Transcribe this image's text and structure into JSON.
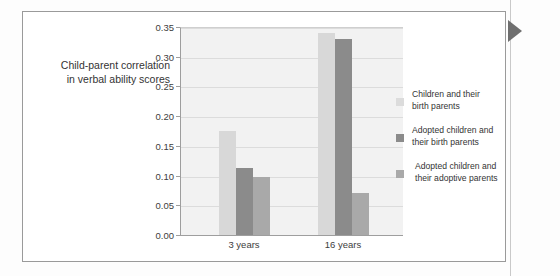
{
  "figure": {
    "nav_arrow_icon": "triangle-right-icon"
  },
  "chart_data": {
    "type": "bar",
    "title": "",
    "subtitle": "",
    "xlabel": "",
    "ylabel": "Child-parent correlation\nin verbal ability scores",
    "ylabel_lines": [
      "Child-parent correlation",
      "in verbal ability scores"
    ],
    "categories": [
      "3 years",
      "16 years"
    ],
    "series": [
      {
        "name": "Children and their birth parents",
        "name_lines": [
          "Children and their",
          "birth parents"
        ],
        "color": "#dcdcdc",
        "values": [
          0.175,
          0.34
        ]
      },
      {
        "name": "Adopted children and their birth parents",
        "name_lines": [
          "Adopted children and",
          "their birth parents"
        ],
        "color": "#8b8b8b",
        "values": [
          0.112,
          0.33
        ]
      },
      {
        "name": "Adopted children and their adoptive parents",
        "name_lines": [
          "Adopted children and",
          "their adoptive parents"
        ],
        "color": "#a9a9a9",
        "values": [
          0.098,
          0.07
        ]
      }
    ],
    "ylim": [
      0.0,
      0.35
    ],
    "ytick_step": 0.05,
    "ytick_labels": [
      "0.00",
      "0.05",
      "0.10",
      "0.15",
      "0.20",
      "0.25",
      "0.30",
      "0.35"
    ],
    "ytick_values": [
      0.0,
      0.05,
      0.1,
      0.15,
      0.2,
      0.25,
      0.3,
      0.35
    ],
    "grid": true,
    "legend_position": "right",
    "plot_background": "#f2f2f2",
    "axis_color": "#9e9e9e",
    "gridline_color": "#dcdcdc"
  }
}
